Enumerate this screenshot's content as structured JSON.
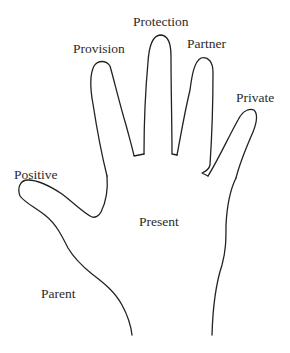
{
  "diagram": {
    "stroke_color": "#222222",
    "background": "#ffffff",
    "labels": {
      "protection": "Protection",
      "provision": "Provision",
      "partner": "Partner",
      "private": "Private",
      "positive": "Positive",
      "present": "Present",
      "parent": "Parent"
    },
    "label_positions": {
      "thumb": "Positive",
      "index_finger": "Provision",
      "middle_finger": "Protection",
      "ring_finger": "Partner",
      "little_finger": "Private",
      "palm": "Present",
      "wrist_side": "Parent"
    }
  }
}
